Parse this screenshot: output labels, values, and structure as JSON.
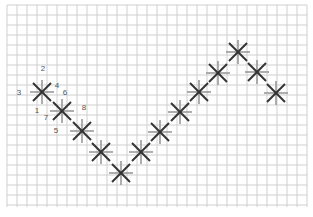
{
  "diagram": {
    "type": "stitch-diagram",
    "grid": {
      "x0": 7,
      "y0": 5,
      "x1": 307,
      "y1": 207,
      "spacing": 10,
      "color": "#cfcfcf"
    },
    "colors": {
      "upright_cross": "#9a9a9a",
      "diagonal_cross": "#333333",
      "label": "#555555"
    },
    "stitches": [
      {
        "x": 42,
        "y": 92
      },
      {
        "x": 62,
        "y": 111
      },
      {
        "x": 82,
        "y": 131
      },
      {
        "x": 101,
        "y": 152
      },
      {
        "x": 121,
        "y": 173
      },
      {
        "x": 141,
        "y": 152
      },
      {
        "x": 160,
        "y": 132
      },
      {
        "x": 180,
        "y": 112
      },
      {
        "x": 199,
        "y": 92
      },
      {
        "x": 218,
        "y": 73
      },
      {
        "x": 238,
        "y": 52
      },
      {
        "x": 257,
        "y": 72
      },
      {
        "x": 276,
        "y": 93
      }
    ],
    "step_labels": [
      {
        "text": "2",
        "x": 43,
        "y": 71
      },
      {
        "text": "3",
        "x": 19,
        "y": 95
      },
      {
        "text": "4",
        "x": 57,
        "y": 88
      },
      {
        "text": "6",
        "x": 65,
        "y": 95
      },
      {
        "text": "1",
        "x": 37,
        "y": 113
      },
      {
        "text": "7",
        "x": 46,
        "y": 120
      },
      {
        "text": "8",
        "x": 84,
        "y": 110
      },
      {
        "text": "5",
        "x": 56,
        "y": 133
      }
    ]
  }
}
